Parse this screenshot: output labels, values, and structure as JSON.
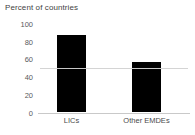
{
  "chart_data": {
    "type": "bar",
    "title": "Percent of countries",
    "xlabel": "",
    "ylabel": "",
    "categories": [
      "LICs",
      "Other EMDEs"
    ],
    "values": [
      88,
      57
    ],
    "series": [
      {
        "name": "Percent of countries",
        "values": [
          88,
          57
        ]
      }
    ],
    "ylim": [
      0,
      100
    ],
    "yticks": [
      0,
      20,
      40,
      60,
      80,
      100
    ],
    "ytick_labels": [
      "0",
      "20",
      "40",
      "60",
      "80",
      "100"
    ],
    "grid": false,
    "legend": false,
    "legend_position": "none",
    "annotations": [
      {
        "name": "reference-line",
        "type": "hline",
        "value": 50,
        "label": "",
        "color": "#d2d2d2"
      }
    ],
    "colors": {
      "bar": "#000000",
      "axis": "#c9c9c9",
      "tick_text": "#5a5a5a",
      "title_text": "#3f3f3f",
      "background": "#ffffff"
    }
  }
}
